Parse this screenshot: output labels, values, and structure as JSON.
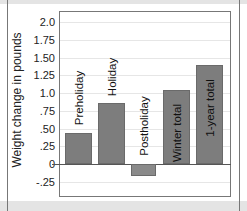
{
  "chart_data": {
    "type": "bar",
    "title": "",
    "xlabel": "",
    "ylabel": "Weight change in pounds",
    "categories": [
      "Preholiday",
      "Holiday",
      "Postholiday",
      "Winter total",
      "1-year total"
    ],
    "values": [
      0.44,
      0.86,
      -0.17,
      1.04,
      1.4
    ],
    "ylim": [
      -0.25,
      2.0
    ],
    "yticks": [
      "2.0",
      "1.75",
      "1.50",
      "1.25",
      "1.0",
      ".75",
      ".50",
      ".25",
      "0",
      "-.25"
    ],
    "ytick_values": [
      2.0,
      1.75,
      1.5,
      1.25,
      1.0,
      0.75,
      0.5,
      0.25,
      0,
      -0.25
    ],
    "grid": true,
    "legend": "none",
    "bar_labels_inside_rotated": true,
    "bar_color": "#7d7d7d"
  }
}
